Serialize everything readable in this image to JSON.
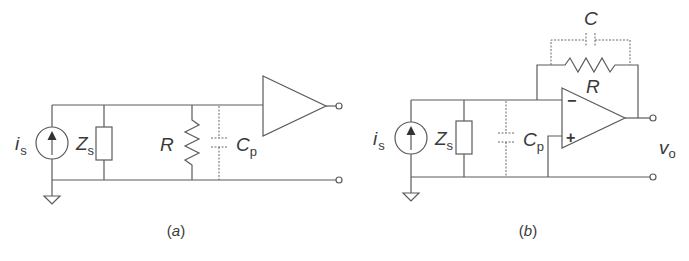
{
  "figure": {
    "panel_a": {
      "caption": "(a)",
      "labels": {
        "source": "i",
        "source_sub": "s",
        "impedance": "Z",
        "impedance_sub": "s",
        "resistor": "R",
        "capacitor": "C",
        "capacitor_sub": "p"
      }
    },
    "panel_b": {
      "caption": "(b)",
      "labels": {
        "source": "i",
        "source_sub": "s",
        "impedance": "Z",
        "impedance_sub": "s",
        "capacitor": "C",
        "capacitor_sub": "p",
        "feedback_capacitor": "C",
        "feedback_resistor": "R",
        "output": "v",
        "output_sub": "o",
        "inverting": "−",
        "non_inverting": "+"
      }
    }
  }
}
